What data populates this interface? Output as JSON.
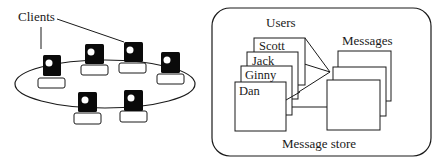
{
  "diagram": {
    "clients_label": "Clients",
    "store": {
      "users_label": "Users",
      "messages_label": "Messages",
      "store_label": "Message store",
      "users": [
        "Scott",
        "Jack",
        "Ginny",
        "Dan"
      ]
    },
    "colors": {
      "stroke": "#1a1a1a",
      "client_body": "#0a0a0a",
      "background": "#ffffff"
    }
  }
}
